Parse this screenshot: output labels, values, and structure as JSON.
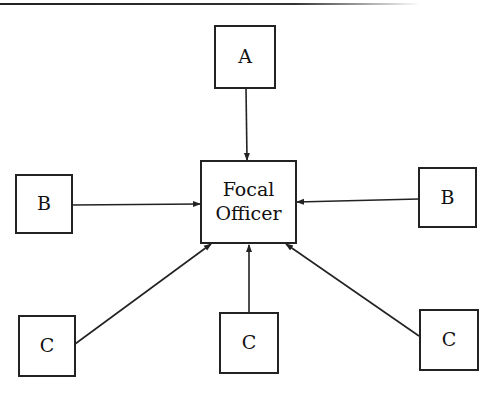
{
  "diagram": {
    "nodes": {
      "a": {
        "label": "A"
      },
      "focal": {
        "line1": "Focal",
        "line2": "Officer"
      },
      "b_left": {
        "label": "B"
      },
      "b_right": {
        "label": "B"
      },
      "c_left": {
        "label": "C"
      },
      "c_center": {
        "label": "C"
      },
      "c_right": {
        "label": "C"
      }
    },
    "edges": [
      {
        "from": "A",
        "to": "Focal Officer"
      },
      {
        "from": "B (left)",
        "to": "Focal Officer"
      },
      {
        "from": "B (right)",
        "to": "Focal Officer"
      },
      {
        "from": "C (left)",
        "to": "Focal Officer"
      },
      {
        "from": "C (center)",
        "to": "Focal Officer"
      },
      {
        "from": "C (right)",
        "to": "Focal Officer"
      }
    ]
  }
}
